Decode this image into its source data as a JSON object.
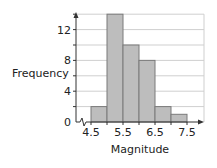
{
  "chart_data": {
    "type": "bar",
    "subtype": "histogram",
    "title": "",
    "xlabel": "Magnitude",
    "ylabel": "Frequency",
    "bins": [
      {
        "from": 4.5,
        "to": 5.0,
        "value": 2
      },
      {
        "from": 5.0,
        "to": 5.5,
        "value": 14
      },
      {
        "from": 5.5,
        "to": 6.0,
        "value": 10
      },
      {
        "from": 6.0,
        "to": 6.5,
        "value": 8
      },
      {
        "from": 6.5,
        "to": 7.0,
        "value": 2
      },
      {
        "from": 7.0,
        "to": 7.5,
        "value": 1
      }
    ],
    "categories": [
      "4.5-5.0",
      "5.0-5.5",
      "5.5-6.0",
      "6.0-6.5",
      "6.5-7.0",
      "7.0-7.5"
    ],
    "values": [
      2,
      14,
      10,
      8,
      2,
      1
    ],
    "x_tick_labels": [
      "4.5",
      "5.5",
      "6.5",
      "7.5"
    ],
    "x_ticks": [
      4.5,
      5.5,
      6.5,
      7.5
    ],
    "y_tick_labels": [
      "0",
      "4",
      "8",
      "12"
    ],
    "y_ticks": [
      0,
      4,
      8,
      12
    ],
    "xlim": [
      4.0,
      8.0
    ],
    "ylim": [
      0,
      14
    ],
    "grid": {
      "horizontal": true,
      "vertical": false,
      "step": 2
    },
    "axis_break_on_x": true,
    "legend": null,
    "colors": {
      "bar_fill": "#bdbdbd",
      "bar_stroke": "#7a7a7a",
      "grid": "#cfcfcf",
      "axis": "#333333",
      "text": "#222222"
    }
  }
}
